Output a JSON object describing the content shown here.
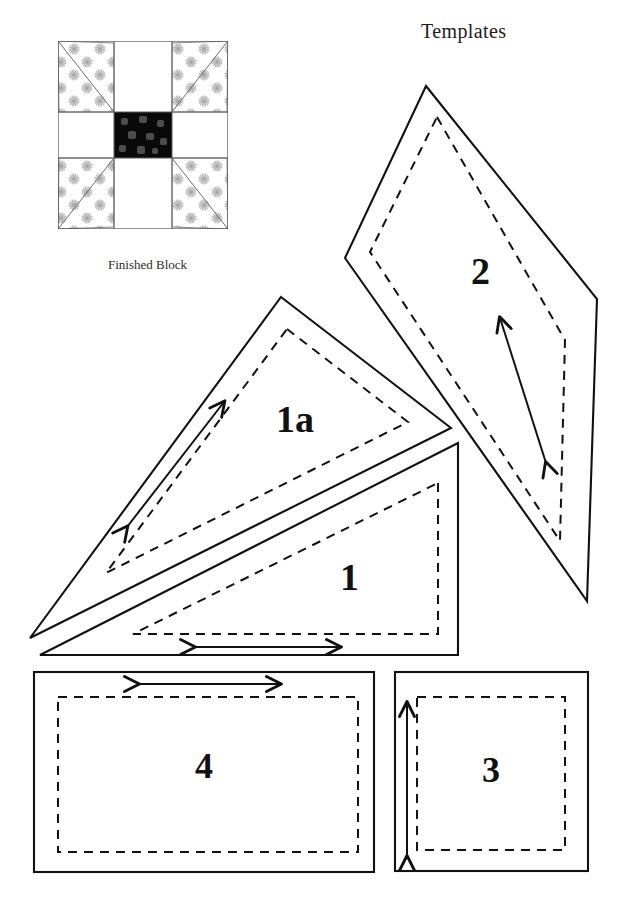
{
  "page": {
    "title": "Templates",
    "background_color": "#ffffff",
    "ink_color": "#111111",
    "width": 621,
    "height": 910
  },
  "finished_block": {
    "caption": "Finished Block",
    "grid": "3x3",
    "center_square_color": "#0a0a0a",
    "center_speckle_color": "#4a4a4a",
    "background_color": "#ffffff",
    "star_print_color": "#b0b0b0",
    "outline_color": "#555555",
    "bounds": {
      "x": 58,
      "y": 41,
      "width": 170,
      "height": 188
    }
  },
  "templates": [
    {
      "id": "template-1a",
      "label": "1a",
      "shape": "triangle",
      "grain_arrow": "double-headed-diagonal",
      "label_x": 276,
      "label_y": 400
    },
    {
      "id": "template-1",
      "label": "1",
      "shape": "right-triangle",
      "grain_arrow": "double-headed-horizontal",
      "label_x": 340,
      "label_y": 558
    },
    {
      "id": "template-2",
      "label": "2",
      "shape": "kite",
      "grain_arrow": "double-headed-diagonal",
      "label_x": 471,
      "label_y": 252
    },
    {
      "id": "template-3",
      "label": "3",
      "shape": "square",
      "grain_arrow": "double-headed-vertical",
      "label_x": 482,
      "label_y": 752
    },
    {
      "id": "template-4",
      "label": "4",
      "shape": "rectangle",
      "grain_arrow": "double-headed-horizontal",
      "label_x": 195,
      "label_y": 748
    }
  ],
  "legend": {
    "solid_line_meaning": "cutting line",
    "dashed_line_meaning": "sewing line",
    "arrow_meaning": "grain line"
  }
}
